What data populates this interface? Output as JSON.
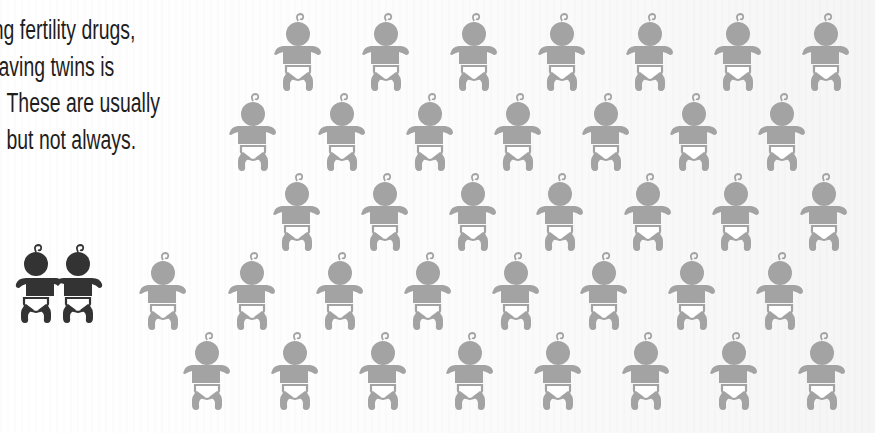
{
  "caption": {
    "lines": [
      "ng fertility drugs,",
      "aving twins is",
      "These are usually",
      "but not always."
    ]
  },
  "colors": {
    "text": "#1e1e1e",
    "baby_grey": "#a3a3a3",
    "twins_dark": "#333333",
    "background": "#fbfbfb"
  },
  "icons": {
    "baby": "baby-icon",
    "twins": "twin-babies-icon"
  },
  "grid": {
    "baby_count": 36,
    "rows": [
      {
        "top": 8,
        "centers": [
          298,
          386,
          474,
          562,
          650,
          738,
          826
        ]
      },
      {
        "top": 88,
        "centers": [
          253,
          342,
          430,
          518,
          606,
          694,
          782
        ]
      },
      {
        "top": 168,
        "centers": [
          297,
          385,
          473,
          560,
          648,
          736,
          824
        ]
      },
      {
        "top": 247,
        "centers": [
          163,
          252,
          340,
          428,
          516,
          604,
          692,
          780
        ]
      },
      {
        "top": 327,
        "centers": [
          207,
          295,
          383,
          470,
          558,
          646,
          734,
          822
        ]
      }
    ]
  }
}
